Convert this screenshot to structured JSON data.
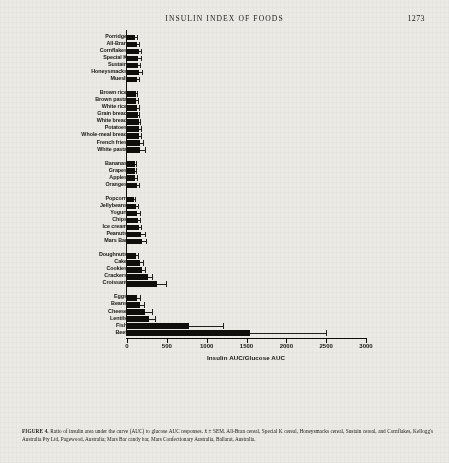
{
  "header": {
    "running_title": "INSULIN INDEX OF FOODS",
    "page_number": "1273"
  },
  "caption": {
    "label": "FIGURE 4.",
    "text": " Ratio of insulin area under the curve (AUC) to glucose AUC responses. x̄ ± SEM. All-Bran cereal, Special K cereal, Honeysmacks cereal, Sustain cereal, and Cornflakes, Kellogg's Australia Pty Ltd, Pagewood, Australia; Mars Bar candy bar, Mars Confectionary Australia, Ballarat, Australia."
  },
  "chart_data": {
    "type": "bar",
    "orientation": "horizontal",
    "title": "",
    "xlabel": "Insulin AUC/Glucose AUC",
    "ylabel": "",
    "xlim": [
      0,
      3000
    ],
    "xticks": [
      0,
      500,
      1000,
      1500,
      2000,
      2500,
      3000
    ],
    "xtick_labels": [
      "0",
      "500",
      "1000",
      "1500",
      "2000",
      "2500",
      "3000"
    ],
    "grid": false,
    "legend": false,
    "error_bars": "SEM",
    "groups": [
      {
        "name": "breakfast-cereals",
        "items": [
          {
            "label": "Porridge",
            "value": 105,
            "error": 18
          },
          {
            "label": "All-Bran",
            "value": 130,
            "error": 22
          },
          {
            "label": "Cornflakes",
            "value": 150,
            "error": 26
          },
          {
            "label": "Special K",
            "value": 140,
            "error": 30
          },
          {
            "label": "Sustain",
            "value": 135,
            "error": 28
          },
          {
            "label": "Honeysmacks",
            "value": 155,
            "error": 34
          },
          {
            "label": "Muesli",
            "value": 120,
            "error": 30
          }
        ]
      },
      {
        "name": "breads-and-starches",
        "items": [
          {
            "label": "Brown rice",
            "value": 110,
            "error": 20
          },
          {
            "label": "Brown pasta",
            "value": 115,
            "error": 18
          },
          {
            "label": "White rice",
            "value": 125,
            "error": 22
          },
          {
            "label": "Grain bread",
            "value": 135,
            "error": 20
          },
          {
            "label": "White bread",
            "value": 145,
            "error": 24
          },
          {
            "label": "Potatoes",
            "value": 150,
            "error": 26
          },
          {
            "label": "Whole-meal bread",
            "value": 150,
            "error": 28
          },
          {
            "label": "French fries",
            "value": 160,
            "error": 40
          },
          {
            "label": "White pasta",
            "value": 165,
            "error": 55
          }
        ]
      },
      {
        "name": "fruits",
        "items": [
          {
            "label": "Bananas",
            "value": 95,
            "error": 18
          },
          {
            "label": "Grapes",
            "value": 100,
            "error": 16
          },
          {
            "label": "Apples",
            "value": 105,
            "error": 18
          },
          {
            "label": "Oranges",
            "value": 130,
            "error": 22
          }
        ]
      },
      {
        "name": "snacks-and-confectionery",
        "items": [
          {
            "label": "Popcorn",
            "value": 90,
            "error": 16
          },
          {
            "label": "Jellybeans",
            "value": 110,
            "error": 24
          },
          {
            "label": "Yogurt",
            "value": 125,
            "error": 34
          },
          {
            "label": "Chips",
            "value": 135,
            "error": 28
          },
          {
            "label": "Ice cream",
            "value": 150,
            "error": 30
          },
          {
            "label": "Peanuts",
            "value": 175,
            "error": 45
          },
          {
            "label": "Mars Bar",
            "value": 190,
            "error": 45
          }
        ]
      },
      {
        "name": "bakery-products",
        "items": [
          {
            "label": "Doughnuts",
            "value": 115,
            "error": 20
          },
          {
            "label": "Cake",
            "value": 160,
            "error": 35
          },
          {
            "label": "Cookies",
            "value": 190,
            "error": 35
          },
          {
            "label": "Crackers",
            "value": 260,
            "error": 60
          },
          {
            "label": "Croissant",
            "value": 380,
            "error": 110
          }
        ]
      },
      {
        "name": "protein-foods",
        "items": [
          {
            "label": "Eggs",
            "value": 120,
            "error": 45
          },
          {
            "label": "Beans",
            "value": 165,
            "error": 45
          },
          {
            "label": "Cheese",
            "value": 230,
            "error": 90
          },
          {
            "label": "Lentils",
            "value": 275,
            "error": 80
          },
          {
            "label": "Fish",
            "value": 780,
            "error": 420
          },
          {
            "label": "Beef",
            "value": 1550,
            "error": 950
          }
        ]
      }
    ]
  }
}
